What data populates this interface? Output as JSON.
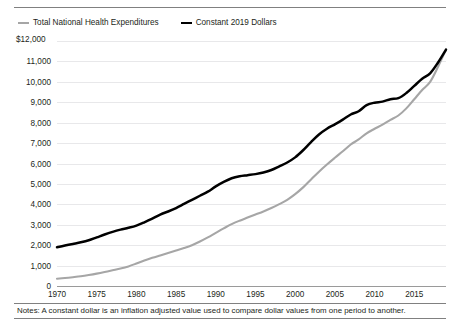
{
  "legend": {
    "items": [
      {
        "label": "Total National Health Expenditures",
        "color": "#a6a6a6",
        "style": "gray"
      },
      {
        "label": "Constant 2019 Dollars",
        "color": "#000000",
        "style": "black"
      }
    ]
  },
  "axis": {
    "y_unit_label": "$12,000"
  },
  "notes": {
    "text": "Notes: A constant dollar is an inflation adjusted value used to compare dollar values from one period to another."
  },
  "chart_data": {
    "type": "line",
    "title": "",
    "subtitle": "",
    "xlabel": "",
    "ylabel": "$12,000",
    "grid": true,
    "legend_position": "top-left",
    "xlim": [
      1970,
      2019
    ],
    "ylim": [
      0,
      12000
    ],
    "ytick_labels": [
      "$12,000",
      "11,000",
      "10,000",
      "9,000",
      "8,000",
      "7,000",
      "6,000",
      "5,000",
      "4,000",
      "3,000",
      "2,000",
      "1,000",
      "0"
    ],
    "ytick_values": [
      12000,
      11000,
      10000,
      9000,
      8000,
      7000,
      6000,
      5000,
      4000,
      3000,
      2000,
      1000,
      0
    ],
    "xtick_labels": [
      "1970",
      "1975",
      "1980",
      "1985",
      "1990",
      "1995",
      "2000",
      "2005",
      "2010",
      "2015"
    ],
    "xtick_values": [
      1970,
      1975,
      1980,
      1985,
      1990,
      1995,
      2000,
      2005,
      2010,
      2015
    ],
    "x": [
      1970,
      1971,
      1972,
      1973,
      1974,
      1975,
      1976,
      1977,
      1978,
      1979,
      1980,
      1981,
      1982,
      1983,
      1984,
      1985,
      1986,
      1987,
      1988,
      1989,
      1990,
      1991,
      1992,
      1993,
      1994,
      1995,
      1996,
      1997,
      1998,
      1999,
      2000,
      2001,
      2002,
      2003,
      2004,
      2005,
      2006,
      2007,
      2008,
      2009,
      2010,
      2011,
      2012,
      2013,
      2014,
      2015,
      2016,
      2017,
      2018,
      2019
    ],
    "series": [
      {
        "name": "Total National Health Expenditures",
        "color": "#a6a6a6",
        "values": [
          355,
          390,
          430,
          475,
          535,
          605,
          685,
          770,
          855,
          960,
          1100,
          1250,
          1380,
          1500,
          1620,
          1740,
          1860,
          2000,
          2180,
          2380,
          2600,
          2820,
          3030,
          3200,
          3350,
          3500,
          3650,
          3820,
          4010,
          4220,
          4500,
          4830,
          5220,
          5600,
          5950,
          6280,
          6600,
          6930,
          7180,
          7480,
          7700,
          7900,
          8140,
          8350,
          8700,
          9150,
          9600,
          10000,
          10740,
          11580
        ]
      },
      {
        "name": "Constant 2019 Dollars",
        "color": "#000000",
        "values": [
          1900,
          1980,
          2060,
          2140,
          2240,
          2380,
          2520,
          2650,
          2760,
          2850,
          2960,
          3120,
          3300,
          3500,
          3650,
          3820,
          4020,
          4220,
          4420,
          4620,
          4880,
          5100,
          5280,
          5380,
          5430,
          5480,
          5560,
          5680,
          5860,
          6050,
          6300,
          6650,
          7050,
          7420,
          7700,
          7920,
          8150,
          8400,
          8560,
          8860,
          8980,
          9030,
          9150,
          9200,
          9450,
          9800,
          10150,
          10420,
          10950,
          11580
        ]
      }
    ]
  }
}
